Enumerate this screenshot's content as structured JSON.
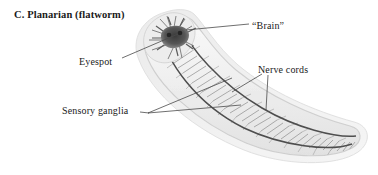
{
  "figure": {
    "title": "C. Planarian (flatworm)",
    "panel_letter": "C.",
    "organism": "Planarian (flatworm)",
    "background_color": "#ffffff",
    "ink_color": "#1a1a1a"
  },
  "labels": {
    "eyespot": "Eyespot",
    "brain": "“Brain”",
    "nerve_cords": "Nerve cords",
    "sensory_ganglia": "Sensory ganglia"
  },
  "anatomy": {
    "body_outline_color": "#d8d8d8",
    "body_fill_color": "#f0f0f0",
    "brain_color": "#4a4a4a",
    "eyespot_color": "#2b2b2b",
    "nerve_cord_color": "#555555",
    "commissure_color": "#8a8a8a",
    "parts": [
      {
        "name": "brain",
        "description": "bilobed dark cerebral ganglion in head"
      },
      {
        "name": "eyespot-left",
        "description": "dark pigmented ocellus"
      },
      {
        "name": "eyespot-right",
        "description": "dark pigmented ocellus"
      },
      {
        "name": "ventral-nerve-cord-left",
        "description": "longitudinal nerve cord running head to tail"
      },
      {
        "name": "ventral-nerve-cord-right",
        "description": "longitudinal nerve cord running head to tail"
      },
      {
        "name": "transverse-commissures",
        "count": 34,
        "description": "ladder-like rungs joining the two cords"
      },
      {
        "name": "sensory-ganglia",
        "description": "lateral ganglia along the nerve cords"
      },
      {
        "name": "head-lobes",
        "description": "auricles with radiating sensory nerve branches"
      },
      {
        "name": "tail",
        "description": "rounded posterior tip"
      }
    ]
  },
  "leaders": {
    "eyespot": "line from label to right eyespot in head",
    "brain": "line from label to dark brain mass",
    "nerve_cords": "two lines from label to both longitudinal cords",
    "sensory_ganglia": "two lines from label to lateral ganglia on body"
  }
}
